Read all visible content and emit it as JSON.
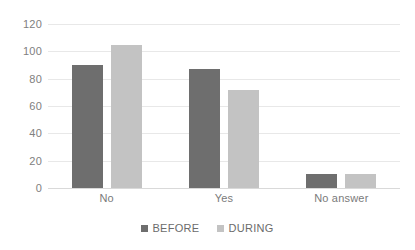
{
  "chart_data": {
    "type": "bar",
    "title": "",
    "xlabel": "",
    "ylabel": "",
    "categories": [
      "No",
      "Yes",
      "No answer"
    ],
    "series": [
      {
        "name": "BEFORE",
        "color": "#6e6e6e",
        "values": [
          90,
          87,
          10
        ]
      },
      {
        "name": "DURING",
        "color": "#c3c3c3",
        "values": [
          105,
          72,
          10
        ]
      }
    ],
    "ylim": [
      0,
      120
    ],
    "yticks": [
      0,
      20,
      40,
      60,
      80,
      100,
      120
    ],
    "ytick_labels": [
      "0",
      "20",
      "40",
      "60",
      "80",
      "100",
      "120"
    ],
    "grid": true,
    "legend_position": "bottom"
  },
  "legend": {
    "items": [
      {
        "label": "BEFORE",
        "color": "#6e6e6e"
      },
      {
        "label": "DURING",
        "color": "#c3c3c3"
      }
    ]
  },
  "colors": {
    "before": "#6e6e6e",
    "during": "#c3c3c3",
    "gridline": "#e8e8e8",
    "axis_text": "#808080",
    "background": "#ffffff"
  }
}
